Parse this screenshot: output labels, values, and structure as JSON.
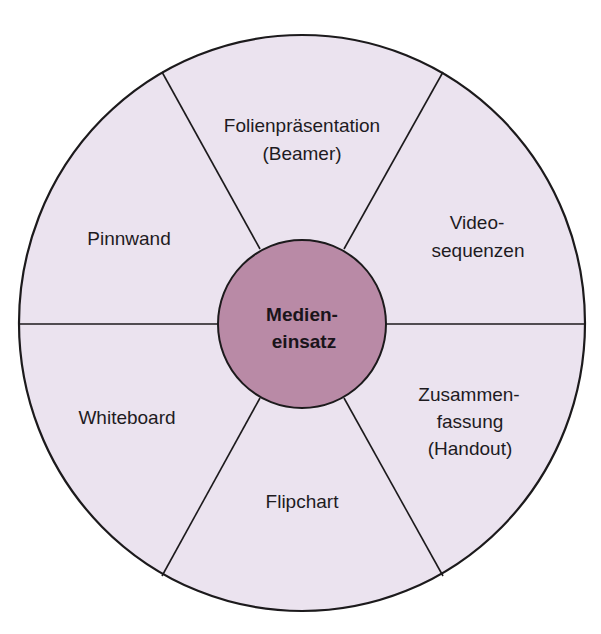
{
  "diagram": {
    "type": "radial-wheel",
    "colors": {
      "segment_fill": "#ebe3ef",
      "center_fill": "#b98aa6",
      "stroke": "#1c1a1c"
    },
    "center": {
      "line1": "Medien-",
      "line2": "einsatz"
    },
    "segments": [
      {
        "id": "top",
        "lines": [
          "Folienpräsentation",
          "(Beamer)"
        ]
      },
      {
        "id": "upper-right",
        "lines": [
          "Video-",
          "sequenzen"
        ]
      },
      {
        "id": "lower-right",
        "lines": [
          "Zusammen-",
          "fassung",
          "(Handout)"
        ]
      },
      {
        "id": "bottom",
        "lines": [
          "Flipchart"
        ]
      },
      {
        "id": "lower-left",
        "lines": [
          "Whiteboard"
        ]
      },
      {
        "id": "upper-left",
        "lines": [
          "Pinnwand"
        ]
      }
    ]
  }
}
